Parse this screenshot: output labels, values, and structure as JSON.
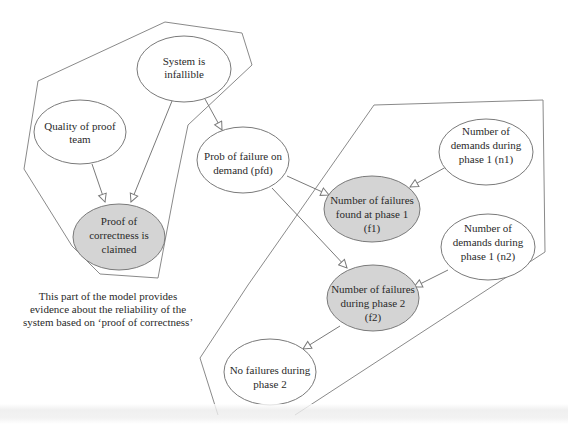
{
  "diagram": {
    "type": "bayesian-network",
    "colors": {
      "observed_fill": "#d4d4d4",
      "node_fill": "#ffffff",
      "stroke": "#7a7a7a",
      "text": "#2a2a2a"
    },
    "nodes": [
      {
        "id": "infallible",
        "lines": [
          "System is",
          "infallible"
        ],
        "observed": false
      },
      {
        "id": "quality",
        "lines": [
          "Quality of proof",
          "team"
        ],
        "observed": false
      },
      {
        "id": "proof",
        "lines": [
          "Proof of",
          "correctness is",
          "claimed"
        ],
        "observed": true
      },
      {
        "id": "pfd",
        "lines": [
          "Prob of failure on",
          "demand (pfd)"
        ],
        "observed": false
      },
      {
        "id": "f1",
        "lines": [
          "Number of failures",
          "found at phase 1",
          "(f1)"
        ],
        "observed": true
      },
      {
        "id": "n1",
        "lines": [
          "Number of",
          "demands during",
          "phase 1 (n1)"
        ],
        "observed": false
      },
      {
        "id": "n2",
        "lines": [
          "Number of",
          "demands during",
          "phase 1 (n2)"
        ],
        "observed": false
      },
      {
        "id": "f2",
        "lines": [
          "Number of failures",
          "during phase 2",
          "(f2)"
        ],
        "observed": true
      },
      {
        "id": "nofail",
        "lines": [
          "No failures during",
          "phase 2"
        ],
        "observed": false
      }
    ],
    "edges": [
      {
        "from": "quality",
        "to": "proof"
      },
      {
        "from": "infallible",
        "to": "proof"
      },
      {
        "from": "infallible",
        "to": "pfd"
      },
      {
        "from": "pfd",
        "to": "f1"
      },
      {
        "from": "pfd",
        "to": "f2"
      },
      {
        "from": "n1",
        "to": "f1"
      },
      {
        "from": "n2",
        "to": "f2"
      },
      {
        "from": "f2",
        "to": "nofail"
      }
    ],
    "caption": "This part of the model provides evidence about the reliability of the system based on ‘proof of correctness’"
  }
}
